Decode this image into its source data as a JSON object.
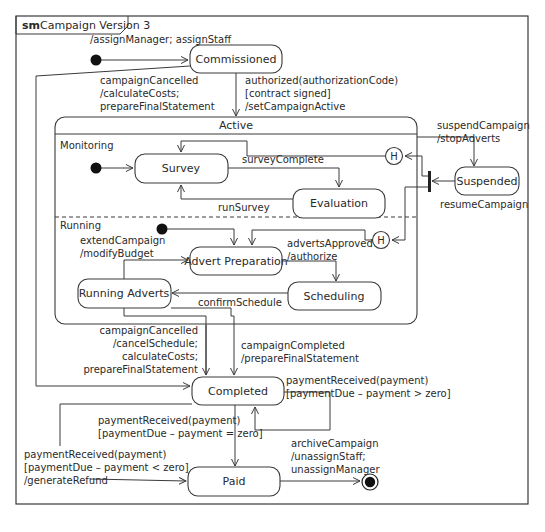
{
  "frame": {
    "keyword": "sm",
    "title": "Campaign Version 3"
  },
  "states": {
    "commissioned": "Commissioned",
    "active": "Active",
    "monitoring_region": "Monitoring",
    "running_region": "Running",
    "survey": "Survey",
    "evaluation": "Evaluation",
    "advert_preparation": "Advert Preparation",
    "scheduling": "Scheduling",
    "running_adverts": "Running Adverts",
    "suspended": "Suspended",
    "completed": "Completed",
    "paid": "Paid",
    "history_monitoring": "H",
    "history_running": "H"
  },
  "transitions": {
    "initial_to_commissioned": [
      "/assignManager; assignStaff"
    ],
    "commissioned_cancelled": [
      "campaignCancelled",
      "/calculateCosts;",
      "prepareFinalStatement"
    ],
    "commissioned_to_active": [
      "authorized(authorizationCode)",
      "[contract signed]",
      "/setCampaignActive"
    ],
    "active_to_suspended": [
      "suspendCampaign",
      "/stopAdverts"
    ],
    "suspended_resume": [
      "resumeCampaign"
    ],
    "survey_to_evaluation": [
      "surveyComplete"
    ],
    "evaluation_to_survey": [
      "runSurvey"
    ],
    "running_to_prep": [
      "extendCampaign",
      "/modifyBudget"
    ],
    "prep_to_scheduling": [
      "advertsApproved",
      "/authorize"
    ],
    "scheduling_to_running": [
      "confirmSchedule"
    ],
    "active_cancelled": [
      "campaignCancelled",
      "/cancelSchedule;",
      "calculateCosts;",
      "prepareFinalStatement"
    ],
    "active_completed": [
      "campaignCompleted",
      "/prepareFinalStatement"
    ],
    "completed_self": [
      "paymentReceived(payment)",
      "[paymentDue – payment > zero]"
    ],
    "completed_to_paid": [
      "paymentReceived(payment)",
      "[paymentDue – payment = zero]"
    ],
    "completed_refund": [
      "paymentReceived(payment)",
      "[paymentDue – payment < zero]",
      "/generateRefund"
    ],
    "paid_to_final": [
      "archiveCampaign",
      "/unassignStaff;",
      "unassignManager"
    ]
  }
}
